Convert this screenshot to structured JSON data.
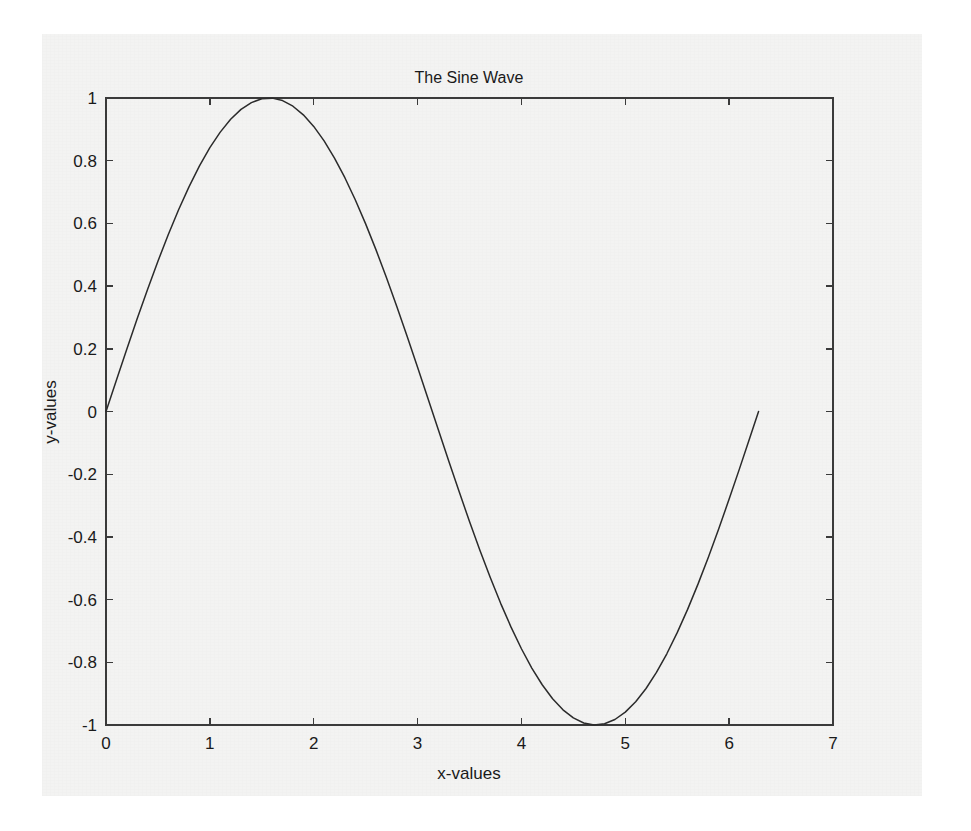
{
  "figure": {
    "background_color": "#f3f3f2",
    "page_background_color": "#ffffff",
    "axes_color": "#3a3a3a",
    "line_color": "#2b2b2b"
  },
  "chart_data": {
    "type": "line",
    "title": "The Sine Wave",
    "xlabel": "x-values",
    "ylabel": "y-values",
    "xlim": [
      0,
      7
    ],
    "ylim": [
      -1,
      1
    ],
    "grid": false,
    "legend": null,
    "xticks": [
      0,
      1,
      2,
      3,
      4,
      5,
      6,
      7
    ],
    "xtick_labels": [
      "0",
      "1",
      "2",
      "3",
      "4",
      "5",
      "6",
      "7"
    ],
    "yticks": [
      -1,
      -0.8,
      -0.6,
      -0.4,
      -0.2,
      0,
      0.2,
      0.4,
      0.6,
      0.8,
      1
    ],
    "ytick_labels": [
      "-1",
      "-0.8",
      "-0.6",
      "-0.4",
      "-0.2",
      "0",
      "0.2",
      "0.4",
      "0.6",
      "0.8",
      "1"
    ],
    "series": [
      {
        "name": "sin(x)",
        "x": [
          0.0,
          0.1,
          0.2,
          0.3,
          0.4,
          0.5,
          0.6,
          0.7,
          0.8,
          0.9,
          1.0,
          1.1,
          1.2,
          1.3,
          1.4,
          1.5,
          1.6,
          1.7,
          1.8,
          1.9,
          2.0,
          2.1,
          2.2,
          2.3,
          2.4,
          2.5,
          2.6,
          2.7,
          2.8,
          2.9,
          3.0,
          3.1,
          3.2,
          3.3,
          3.4,
          3.5,
          3.6,
          3.7,
          3.8,
          3.9,
          4.0,
          4.1,
          4.2,
          4.3,
          4.4,
          4.5,
          4.6,
          4.7,
          4.8,
          4.9,
          5.0,
          5.1,
          5.2,
          5.3,
          5.4,
          5.5,
          5.6,
          5.7,
          5.8,
          5.9,
          6.0,
          6.1,
          6.2,
          6.2832
        ],
        "y": [
          0.0,
          0.0998,
          0.1987,
          0.2955,
          0.3894,
          0.4794,
          0.5646,
          0.6442,
          0.7174,
          0.7833,
          0.8415,
          0.8912,
          0.932,
          0.9636,
          0.9854,
          0.9975,
          0.9996,
          0.9917,
          0.9738,
          0.9463,
          0.9093,
          0.8632,
          0.8085,
          0.7457,
          0.6755,
          0.5985,
          0.5155,
          0.4274,
          0.335,
          0.2392,
          0.1411,
          0.0416,
          -0.0584,
          -0.1577,
          -0.2555,
          -0.3508,
          -0.4425,
          -0.5298,
          -0.6119,
          -0.6878,
          -0.7568,
          -0.8183,
          -0.8716,
          -0.9162,
          -0.9516,
          -0.9775,
          -0.9937,
          -0.99992,
          -0.9962,
          -0.9825,
          -0.9589,
          -0.9258,
          -0.8835,
          -0.8323,
          -0.7728,
          -0.7055,
          -0.6313,
          -0.5507,
          -0.4646,
          -0.3739,
          -0.2794,
          -0.1822,
          -0.0831,
          0.0
        ]
      }
    ],
    "annotations": []
  }
}
